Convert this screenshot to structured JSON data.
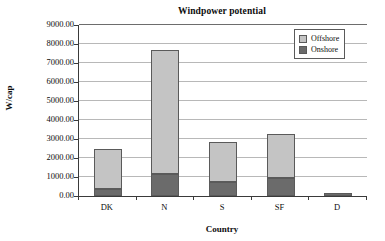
{
  "chart_data": {
    "type": "bar",
    "subtype": "stacked-column",
    "title": "Windpower potential",
    "xlabel": "Country",
    "ylabel": "W/cap",
    "categories": [
      "DK",
      "N",
      "S",
      "SF",
      "D"
    ],
    "series": [
      {
        "name": "Onshore",
        "color": "#6b6b6b",
        "values": [
          350,
          1150,
          750,
          930,
          150
        ]
      },
      {
        "name": "Offshore",
        "color": "#c4c4c4",
        "values": [
          2120,
          6550,
          2100,
          2350,
          0
        ]
      }
    ],
    "totals": [
      2470,
      7700,
      2850,
      3280,
      150
    ],
    "ylim": [
      0,
      9000
    ],
    "ytick_step": 1000,
    "ytick_labels": [
      "9000.00",
      "8000.00",
      "7000.00",
      "6000.00",
      "5000.00",
      "4000.00",
      "3000.00",
      "2000.00",
      "1000.00",
      "0.00"
    ],
    "grid": true,
    "grid_axis": "y",
    "legend_position": "top-right",
    "legend_entries": [
      "Offshore",
      "Onshore"
    ],
    "plot_background": "#ffffff",
    "grid_color": "#b8b8b8",
    "axis_color": "#3a3a3a"
  }
}
